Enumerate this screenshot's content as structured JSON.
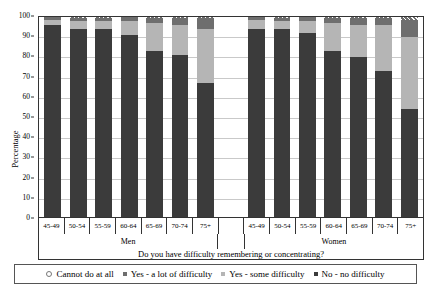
{
  "chart_data": {
    "type": "bar",
    "stacked": true,
    "title": "",
    "xlabel": "Do you have difficulty remembering or concentrating?",
    "ylabel": "Percentage",
    "ylim": [
      0,
      100
    ],
    "ytick_step": 10,
    "yticks": [
      0,
      10,
      20,
      30,
      40,
      50,
      60,
      70,
      80,
      90,
      100
    ],
    "grid": true,
    "legend_position": "bottom",
    "groups": [
      "Men",
      "Women"
    ],
    "categories": [
      "45-49",
      "50-54",
      "55-59",
      "60-64",
      "65-69",
      "70-74",
      "75+"
    ],
    "series": [
      {
        "name": "No - no difficulty",
        "color": "#3b3b3b",
        "values_men": [
          96,
          94,
          94,
          91,
          83,
          81,
          67
        ],
        "values_women": [
          94,
          94,
          92,
          83,
          80,
          73,
          54
        ]
      },
      {
        "name": "Yes - some difficulty",
        "color": "#b5b5b5",
        "values_men": [
          2.5,
          4,
          4,
          7,
          14,
          15,
          27
        ],
        "values_women": [
          4.5,
          4,
          6,
          14,
          16,
          23,
          36
        ]
      },
      {
        "name": "Yes - a lot of difficulty",
        "color": "#6e6e6e",
        "values_men": [
          1.3,
          1.7,
          1.7,
          1.8,
          2.5,
          3.5,
          5.5
        ],
        "values_women": [
          1.3,
          1.7,
          1.8,
          2.7,
          3.5,
          3.7,
          8.5
        ]
      },
      {
        "name": "Cannot do at all",
        "color": "#6e6e6e",
        "hatched": true,
        "values_men": [
          0.2,
          0.3,
          0.3,
          0.2,
          0.5,
          0.5,
          0.5
        ],
        "values_women": [
          0.2,
          0.3,
          0.2,
          0.3,
          0.5,
          0.3,
          1.5
        ]
      }
    ]
  },
  "axis": {
    "y_title": "Percentage",
    "y_labels": [
      "100",
      "90",
      "80",
      "70",
      "60",
      "50",
      "40",
      "30",
      "20",
      "10",
      "0"
    ]
  },
  "xaxis": {
    "men_labels": [
      "45-49",
      "50-54",
      "55-59",
      "60-64",
      "65-69",
      "70-74",
      "75+"
    ],
    "women_labels": [
      "45-49",
      "50-54",
      "55-59",
      "60-64",
      "65-69",
      "70-74",
      "75+"
    ],
    "blank": ""
  },
  "groups": {
    "men": "Men",
    "women": "Women"
  },
  "question": "Do you have difficulty remembering or concentrating?",
  "legend": {
    "items": [
      {
        "label": "Cannot do at all",
        "key": "cannot"
      },
      {
        "label": "Yes - a lot of difficulty",
        "key": "alot"
      },
      {
        "label": "Yes - some difficulty",
        "key": "some"
      },
      {
        "label": "No - no difficulty",
        "key": "none"
      }
    ]
  }
}
